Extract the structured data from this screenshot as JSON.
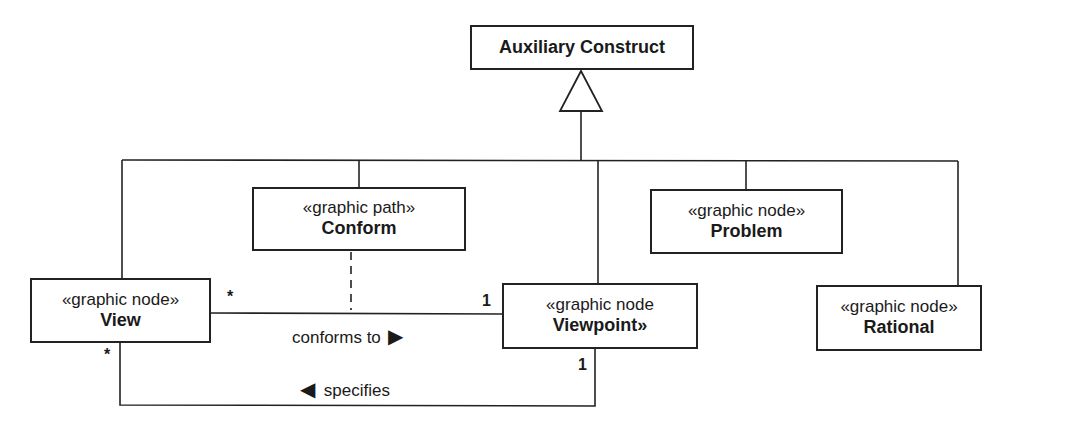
{
  "diagram": {
    "type": "UML class diagram",
    "parent": {
      "name": "Auxiliary Construct"
    },
    "classes": [
      {
        "id": "conform",
        "stereotype": "«graphic path»",
        "name": "Conform"
      },
      {
        "id": "problem",
        "stereotype": "«graphic node»",
        "name": "Problem"
      },
      {
        "id": "view",
        "stereotype": "«graphic node»",
        "name": "View"
      },
      {
        "id": "viewpoint",
        "stereotype": "«graphic node",
        "name": "Viewpoint»"
      },
      {
        "id": "rational",
        "stereotype": "«graphic node»",
        "name": "Rational"
      }
    ],
    "associations": [
      {
        "from": "view",
        "to": "viewpoint",
        "label": "conforms to",
        "direction_glyph": "▶",
        "from_mult": "*",
        "to_mult": "1",
        "association_class": "conform"
      },
      {
        "from": "viewpoint",
        "to": "view",
        "label": "specifies",
        "direction_glyph": "◀",
        "from_mult": "1",
        "to_mult": "*"
      }
    ],
    "generalization": {
      "parent": "Auxiliary Construct",
      "children": [
        "View",
        "Conform",
        "Viewpoint",
        "Problem",
        "Rational"
      ]
    }
  }
}
